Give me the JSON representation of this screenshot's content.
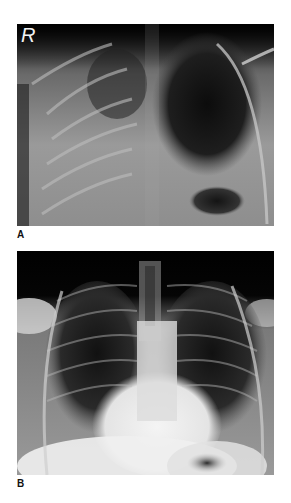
{
  "figure": {
    "panels": [
      {
        "id": "A",
        "label": "A",
        "side_marker": "R",
        "description": "Frontal chest radiograph with diffuse opacification of right hemithorax and dark aerated left upper lung"
      },
      {
        "id": "B",
        "label": "B",
        "description": "Frontal chest radiograph showing both aerated lungs with central mediastinal/cardiac shadow"
      }
    ]
  }
}
